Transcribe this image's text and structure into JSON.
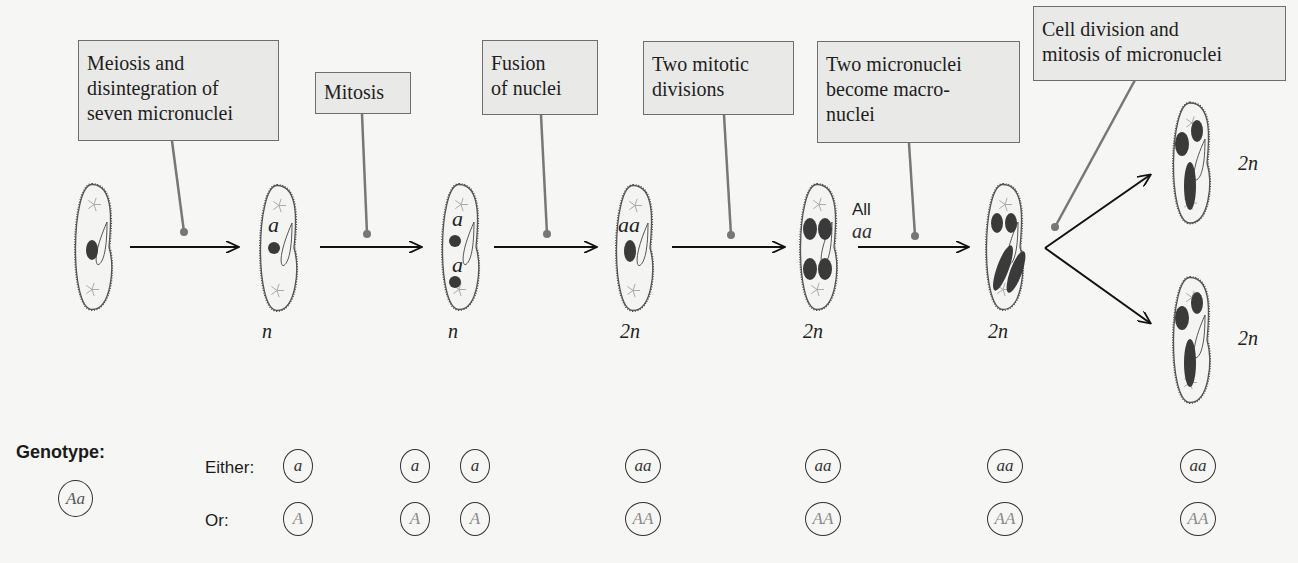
{
  "steps": [
    {
      "label": "Meiosis and\ndisintegration of\nseven micronuclei"
    },
    {
      "label": "Mitosis"
    },
    {
      "label": "Fusion\nof nuclei"
    },
    {
      "label": "Two mitotic\ndivisions"
    },
    {
      "label": "Two micronuclei\nbecome macro-\nnuclei"
    },
    {
      "label": "Cell division and\nmitosis of micronuclei"
    }
  ],
  "cells": [
    {
      "id": "start",
      "nuclei_label": "",
      "ploidy": ""
    },
    {
      "id": "after-meiosis",
      "nuclei_label": "a",
      "ploidy": "n"
    },
    {
      "id": "after-mitosis",
      "nuclei_label": "a a",
      "ploidy": "n"
    },
    {
      "id": "after-fusion",
      "nuclei_label": "aa",
      "ploidy": "2n"
    },
    {
      "id": "after-two-divisions",
      "nuclei_label": "",
      "ploidy": "2n"
    },
    {
      "id": "macronuclei",
      "nuclei_label": "",
      "ploidy": "2n"
    },
    {
      "id": "daughter-top",
      "nuclei_label": "",
      "ploidy": "2n"
    },
    {
      "id": "daughter-bottom",
      "nuclei_label": "",
      "ploidy": "2n"
    }
  ],
  "annotation": {
    "all": "All",
    "genotype": "aa"
  },
  "genotype": {
    "title": "Genotype:",
    "initial": "Aa",
    "either_label": "Either:",
    "or_label": "Or:",
    "either": [
      "a",
      "a",
      "a",
      "aa",
      "aa",
      "aa",
      "aa"
    ],
    "or": [
      "A",
      "A",
      "A",
      "AA",
      "AA",
      "AA",
      "AA"
    ]
  },
  "colors": {
    "nucleus": "#3a3a3a",
    "label_box_fill": "#e9e9e7",
    "pointer": "#777777",
    "arrow": "#111111"
  }
}
